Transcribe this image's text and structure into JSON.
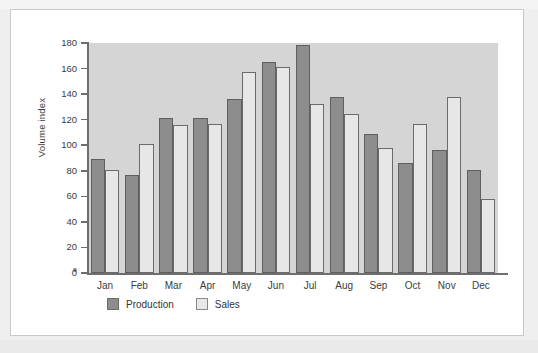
{
  "chart_data": {
    "type": "bar",
    "title": "",
    "xlabel": "",
    "ylabel": "Volume index",
    "ylim": [
      0,
      180
    ],
    "ytick_step": 20,
    "yticks": [
      0,
      20,
      40,
      60,
      80,
      100,
      120,
      140,
      160,
      180
    ],
    "grid": false,
    "legend_position": "bottom-left",
    "categories": [
      "Jan",
      "Feb",
      "Mar",
      "Apr",
      "May",
      "Jun",
      "Jul",
      "Aug",
      "Sep",
      "Oct",
      "Nov",
      "Dec"
    ],
    "series": [
      {
        "name": "Production",
        "color": "#8d8d8d",
        "values": [
          89.5,
          77,
          121,
          121.5,
          136,
          165,
          178.5,
          138,
          108.5,
          86,
          96,
          81
        ]
      },
      {
        "name": "Sales",
        "color": "#e7e7e7",
        "values": [
          81,
          101,
          116,
          116.5,
          157,
          161,
          132.5,
          124.5,
          98,
          117,
          137.5,
          58
        ]
      }
    ]
  },
  "legend": {
    "items": [
      {
        "label": "Production",
        "swatch": "production-swatch"
      },
      {
        "label": "Sales",
        "swatch": "sales-swatch"
      }
    ]
  },
  "colors": {
    "plot_background": "#d5d5d5",
    "figure_background": "#ffffff",
    "page_background": "#efefef",
    "axis": "#6e6e6e",
    "production": "#8d8d8d",
    "sales": "#e7e7e7"
  }
}
